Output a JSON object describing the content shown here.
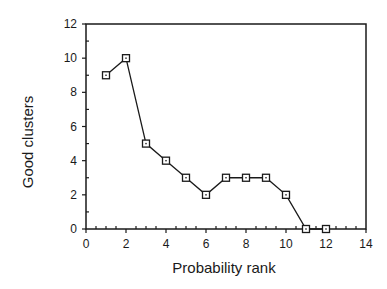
{
  "chart_data": {
    "type": "line",
    "title": "",
    "xlabel": "Probability rank",
    "ylabel": "Good clusters",
    "x": [
      1,
      2,
      3,
      4,
      5,
      6,
      7,
      8,
      9,
      10,
      11,
      12
    ],
    "series": [
      {
        "name": "Good clusters",
        "values": [
          9,
          10,
          5,
          4,
          3,
          2,
          3,
          3,
          3,
          2,
          0,
          0
        ],
        "marker": "open-square"
      }
    ],
    "xlim": [
      0,
      14
    ],
    "ylim": [
      0,
      12
    ],
    "xticks": [
      0,
      2,
      4,
      6,
      8,
      10,
      12,
      14
    ],
    "yticks": [
      0,
      2,
      4,
      6,
      8,
      10,
      12
    ],
    "grid": false,
    "legend": null,
    "colors": {
      "line": "#1a1a1a",
      "axes": "#1a1a1a",
      "background": "#ffffff"
    }
  }
}
